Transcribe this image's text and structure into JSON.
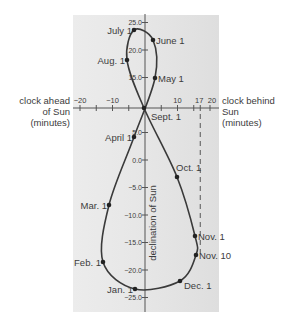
{
  "colors": {
    "panel_left": "#e9e9e9",
    "panel_right": "#e2e2e2",
    "curve": "#3a3a3a",
    "text": "#3c3c3c",
    "axis": "#555555"
  },
  "left_label": [
    "clock ahead",
    "of Sun",
    "(minutes)"
  ],
  "right_label": [
    "clock behind",
    "Sun",
    "(minutes)"
  ],
  "vertical_axis_label": "declination of Sun",
  "x_ticks": [
    {
      "label": "−20",
      "value": -20
    },
    {
      "label": "−10",
      "value": -10
    },
    {
      "label": "10",
      "value": 10
    },
    {
      "label": "17",
      "value": 17
    },
    {
      "label": "20",
      "value": 20
    }
  ],
  "y_ticks": [
    {
      "label": "25.0",
      "value": 25
    },
    {
      "label": "20.0",
      "value": 20
    },
    {
      "label": "15.0",
      "value": 15
    },
    {
      "label": "5.0",
      "value": 5
    },
    {
      "label": "0.0",
      "value": 0
    },
    {
      "label": "−5.0",
      "value": -5
    },
    {
      "label": "−10.0",
      "value": -10
    },
    {
      "label": "−15.0",
      "value": -15
    },
    {
      "label": "−20.0",
      "value": -20
    },
    {
      "label": "−25.0",
      "value": -25
    }
  ],
  "points": [
    {
      "label": "July 1",
      "x": 134,
      "y": 30,
      "side": "left"
    },
    {
      "label": "June 1",
      "x": 153,
      "y": 40,
      "side": "right"
    },
    {
      "label": "Aug. 1",
      "x": 127,
      "y": 60,
      "side": "left"
    },
    {
      "label": "May 1",
      "x": 155,
      "y": 78,
      "side": "right"
    },
    {
      "label": "Sept. 1",
      "x": 144,
      "y": 108,
      "side": "right-below"
    },
    {
      "label": "April 1",
      "x": 134,
      "y": 137,
      "side": "left"
    },
    {
      "label": "Oct. 1",
      "x": 177,
      "y": 177,
      "side": "right-above"
    },
    {
      "label": "Mar. 1",
      "x": 109,
      "y": 205,
      "side": "left"
    },
    {
      "label": "Nov. 1",
      "x": 195,
      "y": 236,
      "side": "right"
    },
    {
      "label": "Nov. 10",
      "x": 196,
      "y": 255,
      "side": "right"
    },
    {
      "label": "Feb. 1",
      "x": 103,
      "y": 262,
      "side": "left"
    },
    {
      "label": "Dec. 1",
      "x": 180,
      "y": 281,
      "side": "right-below"
    },
    {
      "label": "Jan. 1",
      "x": 135,
      "y": 289,
      "side": "left"
    }
  ],
  "chart_data": {
    "type": "line",
    "xlabel": "clock ahead of Sun (minutes) / clock behind Sun (minutes)",
    "ylabel": "declination of Sun",
    "xlim": [
      -20,
      20
    ],
    "ylim": [
      -25,
      25
    ],
    "x_ticks": [
      -20,
      -10,
      10,
      17,
      20
    ],
    "y_ticks": [
      25,
      20,
      15,
      5,
      0,
      -5,
      -10,
      -15,
      -20,
      -25
    ],
    "annotations": [
      "dashed vertical line at x = 17 (Nov. 10)"
    ],
    "series": [
      {
        "name": "Sun position by date",
        "points": [
          {
            "date": "Jan. 1",
            "x": -3,
            "y": -23
          },
          {
            "date": "Feb. 1",
            "x": -13,
            "y": -17.5
          },
          {
            "date": "Mar. 1",
            "x": -11,
            "y": -8
          },
          {
            "date": "April 1",
            "x": -3.5,
            "y": 4.5
          },
          {
            "date": "May 1",
            "x": 3,
            "y": 15
          },
          {
            "date": "June 1",
            "x": 2.5,
            "y": 22
          },
          {
            "date": "July 1",
            "x": -3.5,
            "y": 23.2
          },
          {
            "date": "Aug. 1",
            "x": -5.5,
            "y": 18
          },
          {
            "date": "Sept. 1",
            "x": 0,
            "y": 8.5
          },
          {
            "date": "Oct. 1",
            "x": 10,
            "y": -3
          },
          {
            "date": "Nov. 1",
            "x": 16.5,
            "y": -14
          },
          {
            "date": "Nov. 10",
            "x": 17,
            "y": -17
          },
          {
            "date": "Dec. 1",
            "x": 11,
            "y": -22
          }
        ]
      }
    ]
  }
}
